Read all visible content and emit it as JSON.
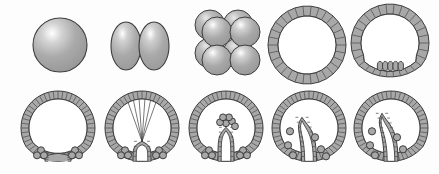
{
  "figure": {
    "background_color": "#fdfdfd",
    "width": 439,
    "height": 174,
    "palette": {
      "cell_fill": "#a8a8a8",
      "cell_fill_dark": "#9a9a9a",
      "outline": "#3d3d3d",
      "division_line": "#4a4a4a",
      "highlight": "#ffffff",
      "cavity_fill": "#ffffff"
    }
  },
  "rows": [
    {
      "row_name": "top-row",
      "stages": [
        {
          "index": 1,
          "name": "zygote",
          "label": "zygote",
          "type": "sphere",
          "cell_count": 1,
          "center": [
            60,
            45
          ],
          "radius": 27,
          "highlight": [
            50,
            33
          ]
        },
        {
          "index": 2,
          "name": "two-cell-stage",
          "label": "2-cell stage",
          "type": "ellipse-pair",
          "cell_count": 2,
          "center": [
            139,
            46
          ],
          "ellipse_rx": 15,
          "ellipse_ry": 24,
          "offsets": [
            -14,
            14
          ]
        },
        {
          "index": 3,
          "name": "eight-cell-stage",
          "label": "8-cell stage",
          "type": "sphere-cluster",
          "cell_count": 8,
          "center": [
            224,
            46
          ],
          "radius": 15,
          "front_grid": [
            [
              -14,
              -14
            ],
            [
              14,
              -14
            ],
            [
              -14,
              14
            ],
            [
              14,
              14
            ]
          ],
          "back_offset": [
            -7,
            -7
          ]
        },
        {
          "index": 4,
          "name": "blastula",
          "label": "blastula",
          "type": "epithelial-ring",
          "center": [
            306,
            45
          ],
          "outer_radius": 39,
          "inner_radius": 29,
          "cell_count": 30
        },
        {
          "index": 5,
          "name": "mesenchyme-blastula",
          "label": "mesenchyme blastula",
          "type": "flattened-vegetal-plate",
          "center": [
            390,
            45
          ],
          "outer_radius": 39,
          "inner_radius": 29,
          "cell_count": 30,
          "ingressing_cells": 5
        }
      ]
    },
    {
      "row_name": "bottom-row",
      "stages": [
        {
          "index": 6,
          "name": "early-invagination",
          "label": "early invagination",
          "type": "gastrula",
          "center": [
            57,
            131
          ],
          "mesenchyme_left": 3,
          "mesenchyme_right": 3,
          "archenteron_depth": 0
        },
        {
          "index": 7,
          "name": "filopodia-extension",
          "label": "archenteron with filopodia",
          "type": "gastrula",
          "center": [
            141,
            131
          ],
          "filopodia_count": 6,
          "mesenchyme_left": 3,
          "mesenchyme_right": 3,
          "archenteron_depth": 1
        },
        {
          "index": 8,
          "name": "archenteron-elongation",
          "label": "archenteron elongation",
          "type": "gastrula",
          "center": [
            225,
            131
          ],
          "secondary_mesenchyme_cluster": 6,
          "mesenchyme_left": 3,
          "mesenchyme_right": 3,
          "archenteron_depth": 2
        },
        {
          "index": 9,
          "name": "archenteron-bending",
          "label": "archenteron bending toward wall",
          "type": "late-gastrula",
          "center": [
            308,
            131
          ],
          "mesenchyme_scattered": 6,
          "archenteron_depth": 3
        },
        {
          "index": 10,
          "name": "mouth-formation",
          "label": "mouth formation",
          "type": "late-gastrula",
          "center": [
            390,
            131
          ],
          "mesenchyme_scattered": 5,
          "archenteron_depth": 4
        }
      ]
    }
  ]
}
